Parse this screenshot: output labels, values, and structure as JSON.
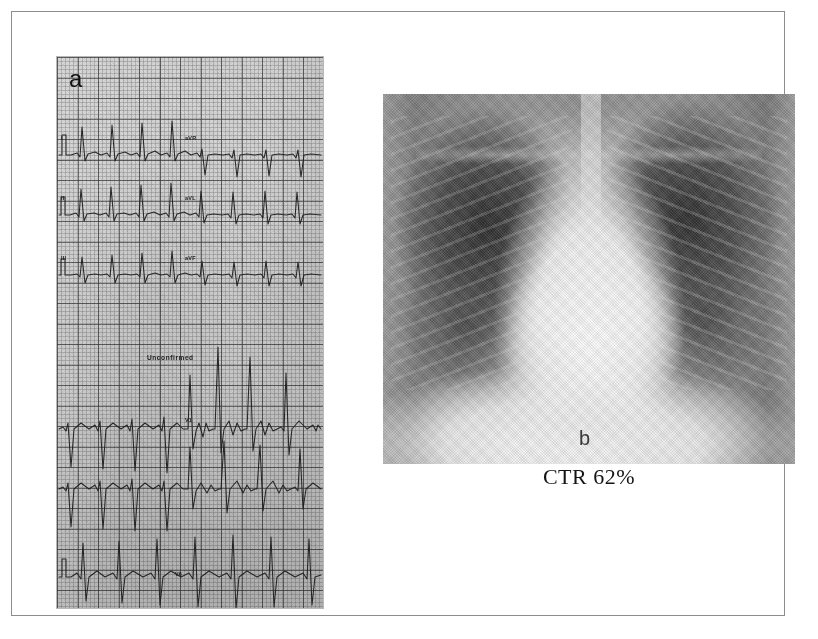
{
  "figure": {
    "panels": [
      {
        "id": "a",
        "label": "a",
        "kind": "electrocardiogram",
        "annotations": {
          "status": "Unconfirmed"
        },
        "lead_tags": [
          {
            "text": "I",
            "x": 4,
            "y": 80
          },
          {
            "text": "aVR",
            "x": 128,
            "y": 80
          },
          {
            "text": "II",
            "x": 4,
            "y": 140
          },
          {
            "text": "aVL",
            "x": 128,
            "y": 140
          },
          {
            "text": "III",
            "x": 4,
            "y": 200
          },
          {
            "text": "aVF",
            "x": 128,
            "y": 200
          },
          {
            "text": "V1",
            "x": 128,
            "y": 362
          },
          {
            "text": "V6",
            "x": 118,
            "y": 516
          }
        ]
      },
      {
        "id": "b",
        "label": "b",
        "kind": "chest-radiograph",
        "caption": "CTR 62%"
      }
    ]
  },
  "colors": {
    "frame_border": "#8d8d8d",
    "ecg_paper": "#cdcdcd",
    "ecg_grid": "#555555",
    "ecg_trace": "#1a1a1a",
    "xray_background": "#8b8b8b",
    "text": "#141414"
  }
}
